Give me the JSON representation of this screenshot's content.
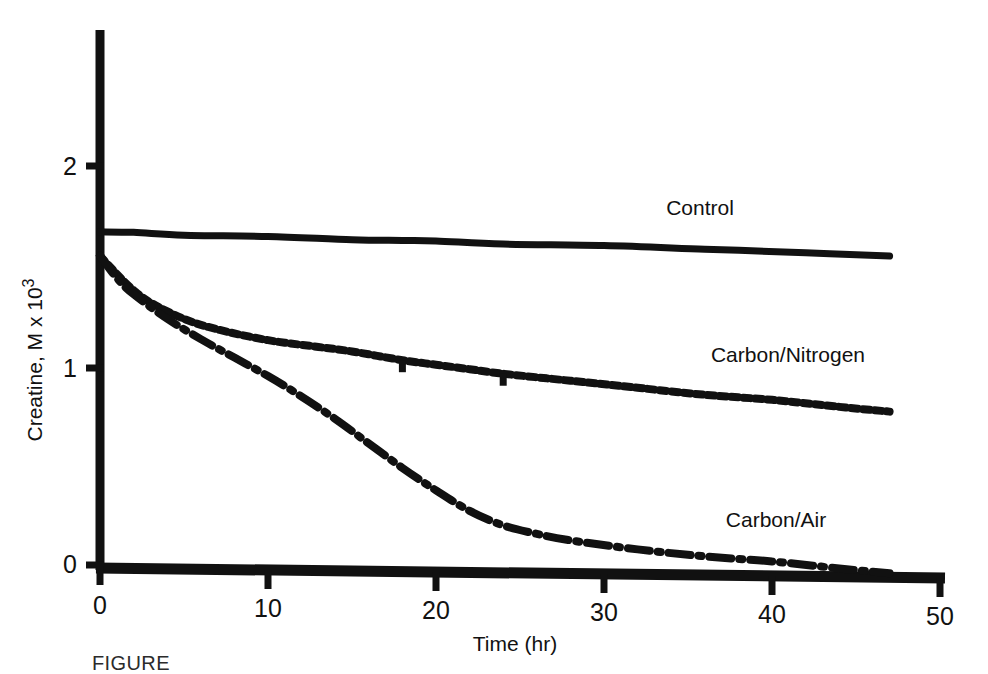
{
  "figure": {
    "caption": "FIGURE",
    "background_color": "#ffffff",
    "ink_color": "#111111"
  },
  "axes": {
    "x_title": "Time (hr)",
    "y_title_main": "Creatine, M x 10",
    "y_title_exponent": "3",
    "x_ticks": [
      "0",
      "10",
      "20",
      "30",
      "40",
      "50"
    ],
    "y_ticks": [
      "0",
      "1",
      "2"
    ]
  },
  "labels": {
    "control": "Control",
    "carbon_nitrogen": "Carbon/Nitrogen",
    "carbon_air": "Carbon/Air"
  },
  "chart_data": {
    "type": "line",
    "title": "",
    "xlabel": "Time (hr)",
    "ylabel": "Creatine, M x 10^3",
    "xlim": [
      0,
      50
    ],
    "ylim": [
      0,
      2.35
    ],
    "xticks": [
      0,
      10,
      20,
      30,
      40,
      50
    ],
    "yticks": [
      0,
      1,
      2
    ],
    "grid": false,
    "legend_position": "inline-right-of-curves",
    "series": [
      {
        "name": "Control",
        "style": "solid",
        "color": "#111111",
        "x": [
          0,
          2,
          5,
          10,
          15,
          18,
          20,
          24,
          30,
          36,
          42,
          47
        ],
        "y": [
          1.67,
          1.67,
          1.66,
          1.66,
          1.65,
          1.65,
          1.65,
          1.64,
          1.64,
          1.63,
          1.62,
          1.61
        ]
      },
      {
        "name": "Carbon/Nitrogen",
        "style": "dotted",
        "color": "#111111",
        "x": [
          0,
          1,
          2,
          3,
          5,
          7,
          10,
          13,
          15,
          18,
          20,
          22,
          24,
          28,
          32,
          36,
          40,
          44,
          47
        ],
        "y": [
          1.55,
          1.46,
          1.38,
          1.32,
          1.24,
          1.19,
          1.14,
          1.11,
          1.09,
          1.05,
          1.03,
          1.01,
          0.99,
          0.96,
          0.93,
          0.9,
          0.88,
          0.85,
          0.83
        ]
      },
      {
        "name": "Carbon/Air",
        "style": "dash-dot",
        "color": "#111111",
        "x": [
          0,
          1,
          2,
          4,
          6,
          8,
          10,
          12,
          14,
          16,
          18,
          20,
          22,
          24,
          26,
          28,
          32,
          36,
          40,
          44,
          47
        ],
        "y": [
          1.55,
          1.44,
          1.36,
          1.24,
          1.14,
          1.05,
          0.96,
          0.86,
          0.75,
          0.63,
          0.51,
          0.4,
          0.3,
          0.23,
          0.19,
          0.16,
          0.12,
          0.09,
          0.07,
          0.04,
          0.02
        ]
      }
    ]
  }
}
